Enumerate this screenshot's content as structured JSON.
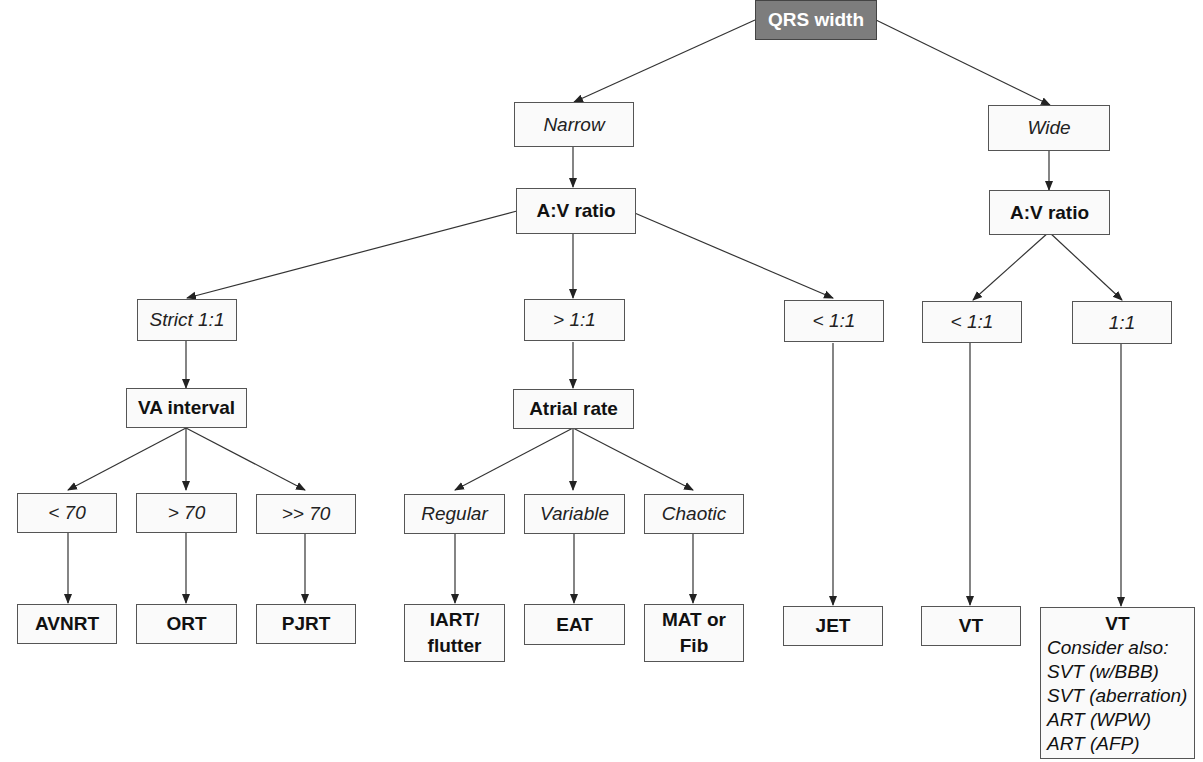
{
  "diagram": {
    "root": {
      "label": "QRS width"
    },
    "nodes": {
      "narrow": "Narrow",
      "wide": "Wide",
      "narrow_av_ratio": "A:V ratio",
      "wide_av_ratio": "A:V ratio",
      "strict_1_1": "Strict 1:1",
      "gt_1_1": "> 1:1",
      "narrow_lt_1_1": "< 1:1",
      "wide_lt_1_1": "< 1:1",
      "wide_1_1": "1:1",
      "va_interval": "VA interval",
      "atrial_rate": "Atrial rate",
      "lt_70": "< 70",
      "gt_70": "> 70",
      "gtgt_70": ">> 70",
      "regular": "Regular",
      "variable": "Variable",
      "chaotic": "Chaotic",
      "avnrt": "AVNRT",
      "ort": "ORT",
      "pjrt": "PJRT",
      "iart_line1": "IART/",
      "iart_line2": "flutter",
      "eat": "EAT",
      "mat_line1": "MAT or",
      "mat_line2": "Fib",
      "jet": "JET",
      "vt": "VT",
      "vt_wide_title": "VT",
      "vt_wide_notes": [
        "Consider also:",
        "SVT (w/BBB)",
        "SVT (aberration)",
        "ART (WPW)",
        "ART (AFP)"
      ]
    },
    "colors": {
      "root_fill": "#7d7d7d",
      "root_text": "#ffffff",
      "box_border": "#555555",
      "box_fill": "#fafafa",
      "line": "#333333"
    }
  }
}
